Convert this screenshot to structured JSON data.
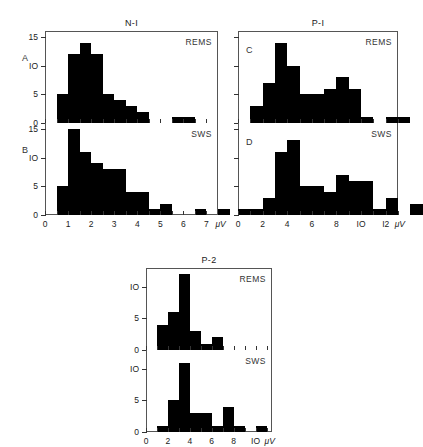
{
  "figure": {
    "unit_label": "μV",
    "groups": [
      {
        "id": "N-1",
        "title": "N-I",
        "x_axis": {
          "min": 0,
          "max": 7.5,
          "ticks": [
            0,
            0.5,
            1,
            1.5,
            2,
            2.5,
            3,
            3.5,
            4,
            4.5,
            5,
            5.5,
            6,
            6.5,
            7
          ],
          "labeled_ticks": [
            0,
            1,
            2,
            3,
            4,
            5,
            6,
            7
          ],
          "tick_labels": [
            "0",
            "1",
            "2",
            "3",
            "4",
            "5",
            "6",
            "7"
          ]
        },
        "y_axis": {
          "min": 0,
          "max": 16,
          "ticks": [
            0,
            5,
            10,
            15
          ],
          "tick_labels": [
            "0",
            "5",
            "IO",
            "15"
          ]
        },
        "panels": [
          {
            "letter": "A",
            "state": "REMS",
            "bin_width": 0.5,
            "bin_start": 0.5,
            "values": [
              5,
              12,
              14,
              12,
              5,
              4,
              3,
              2,
              0,
              0,
              1,
              1,
              0,
              0
            ]
          },
          {
            "letter": "B",
            "state": "SWS",
            "bin_width": 0.5,
            "bin_start": 0.5,
            "values": [
              5,
              15,
              11,
              9,
              8,
              8,
              4,
              4,
              1,
              2,
              0,
              0,
              1,
              0,
              1
            ]
          }
        ]
      },
      {
        "id": "P-1",
        "title": "P-I",
        "x_axis": {
          "min": 0,
          "max": 13,
          "ticks": [
            0,
            1,
            2,
            3,
            4,
            5,
            6,
            7,
            8,
            9,
            10,
            11,
            12,
            13
          ],
          "labeled_ticks": [
            0,
            2,
            4,
            6,
            8,
            10,
            12
          ],
          "tick_labels": [
            "0",
            "2",
            "4",
            "6",
            "8",
            "IO",
            "I2"
          ]
        },
        "y_axis": {
          "min": 0,
          "max": 16,
          "ticks": [
            0,
            5,
            10,
            15
          ],
          "tick_labels": [
            "0",
            "5",
            "IO",
            "15"
          ]
        },
        "panels": [
          {
            "letter": "C",
            "state": "REMS",
            "bin_width": 1,
            "bin_start": 1,
            "values": [
              3,
              7,
              14,
              10,
              5,
              5,
              6,
              8,
              6,
              1,
              0,
              1,
              1
            ]
          },
          {
            "letter": "D",
            "state": "SWS",
            "bin_width": 1,
            "bin_start": 0,
            "values": [
              1,
              1,
              3,
              11,
              13,
              5,
              5,
              4,
              7,
              6,
              6,
              1,
              3,
              0,
              2
            ]
          }
        ]
      },
      {
        "id": "P-2",
        "title": "P-2",
        "x_axis": {
          "min": 0,
          "max": 11.5,
          "ticks": [
            0,
            1,
            2,
            3,
            4,
            5,
            6,
            7,
            8,
            9,
            10,
            11
          ],
          "labeled_ticks": [
            0,
            2,
            4,
            6,
            8,
            10
          ],
          "tick_labels": [
            "0",
            "2",
            "4",
            "6",
            "8",
            "IO"
          ]
        },
        "y_axis": {
          "min": 0,
          "max": 13,
          "ticks": [
            0,
            5,
            10
          ],
          "tick_labels": [
            "0",
            "5",
            "IO"
          ]
        },
        "panels": [
          {
            "letter": "",
            "state": "REMS",
            "bin_width": 0.5,
            "bin_start": 1,
            "values": [
              4,
              4,
              6,
              6,
              12,
              12,
              3,
              3,
              1,
              1,
              2,
              2
            ]
          },
          {
            "letter": "",
            "state": "SWS",
            "bin_width": 0.5,
            "bin_start": 1,
            "values": [
              1,
              1,
              5,
              5,
              11,
              11,
              3,
              3,
              3,
              3,
              1,
              1,
              4,
              4,
              1,
              1,
              0,
              0,
              1,
              1
            ]
          }
        ]
      }
    ]
  }
}
